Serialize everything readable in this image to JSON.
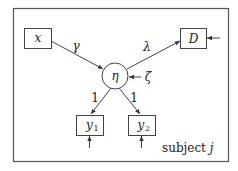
{
  "diagram": {
    "type": "path-diagram",
    "frame_label": {
      "text": "subject ",
      "var": "j"
    },
    "nodes": {
      "x": {
        "label": "x",
        "shape": "rect"
      },
      "D": {
        "label": "D",
        "shape": "rect"
      },
      "eta": {
        "label": "η",
        "shape": "circle"
      },
      "y1": {
        "label": "y",
        "subscript": "1",
        "shape": "rect"
      },
      "y2": {
        "label": "y",
        "subscript": "2",
        "shape": "rect"
      }
    },
    "edges": [
      {
        "from": "x",
        "to": "eta",
        "label": "γ"
      },
      {
        "from": "eta",
        "to": "D",
        "label": "λ"
      },
      {
        "from": "eta",
        "to": "y1",
        "label": "1"
      },
      {
        "from": "eta",
        "to": "y2",
        "label": "1"
      }
    ],
    "disturbances": [
      {
        "target": "eta",
        "label": "ζ"
      },
      {
        "target": "D",
        "label": ""
      },
      {
        "target": "y1",
        "label": ""
      },
      {
        "target": "y2",
        "label": ""
      }
    ]
  }
}
